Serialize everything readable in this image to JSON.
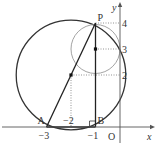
{
  "diagram": {
    "axes": {
      "x_label": "x",
      "y_label": "y",
      "origin_label": "O"
    },
    "points": [
      {
        "name": "P",
        "x": -1,
        "y": 4
      },
      {
        "name": "A",
        "x": -3,
        "y": 0
      },
      {
        "name": "B",
        "x": -1,
        "y": 0
      }
    ],
    "centers": [
      {
        "name": "big-circle-center",
        "x": -2,
        "y": 2
      },
      {
        "name": "small-circle-center",
        "x": -1,
        "y": 3
      }
    ],
    "circles": [
      {
        "name": "big-circle",
        "cx": -2,
        "cy": 2,
        "r": 2.2360679
      },
      {
        "name": "small-circle",
        "cx": -1,
        "cy": 3,
        "r": 1
      }
    ],
    "x_ticks": [
      {
        "value": -3,
        "label": "−3"
      },
      {
        "value": -2,
        "label": "−2"
      },
      {
        "value": -1,
        "label": "−1"
      }
    ],
    "y_ticks": [
      {
        "value": 4,
        "label": "4"
      },
      {
        "value": 3,
        "label": "3"
      },
      {
        "value": 2,
        "label": "2"
      }
    ]
  }
}
